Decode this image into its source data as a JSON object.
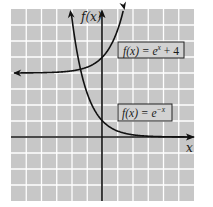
{
  "chart_data": {
    "type": "line",
    "title": "",
    "xlabel": "x",
    "ylabel": "f(x)",
    "xlim": [
      -6,
      6
    ],
    "ylim": [
      -4,
      8
    ],
    "grid": true,
    "tick_labels_shown": false,
    "series": [
      {
        "name": "f(x) = e^x + 4",
        "expression": "e^x + 4",
        "horizontal_asymptote": 4,
        "y_intercept": 5,
        "x": [
          -6,
          -5,
          -4,
          -3,
          -2,
          -1,
          0,
          0.5,
          1,
          1.39
        ],
        "y": [
          4.0,
          4.01,
          4.02,
          4.05,
          4.14,
          4.37,
          5.0,
          5.65,
          6.72,
          8.0
        ]
      },
      {
        "name": "f(x) = e^-x",
        "expression": "e^-x",
        "horizontal_asymptote": 0,
        "y_intercept": 1,
        "x": [
          -2.08,
          -1.5,
          -1,
          -0.5,
          0,
          1,
          2,
          3,
          4,
          5,
          6
        ],
        "y": [
          8.0,
          4.48,
          2.72,
          1.65,
          1.0,
          0.37,
          0.14,
          0.05,
          0.02,
          0.01,
          0.0
        ]
      }
    ],
    "annotations": [
      {
        "text": "f(x) = e^x + 4",
        "target_series": 0
      },
      {
        "text": "f(x) = e^-x",
        "target_series": 1
      }
    ]
  },
  "labels": {
    "y_axis": "f(x)",
    "x_axis": "x",
    "box1": {
      "prefix": "f(x) = e",
      "sup": "x",
      "suffix": " + 4"
    },
    "box2": {
      "prefix": "f(x) = e",
      "sup": "−x",
      "suffix": ""
    }
  },
  "colors": {
    "background": "#c7c7c7",
    "grid": "#ffffff",
    "axis": "#111111",
    "curve": "#111111",
    "box_fill": "#d2d2d2"
  }
}
